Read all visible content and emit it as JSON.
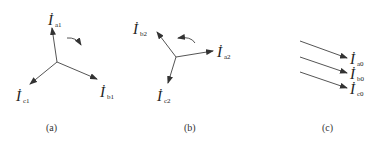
{
  "diagram": {
    "panels": [
      {
        "id": "a",
        "caption": "(a)",
        "type": "positive-sequence phasors",
        "rotation": "clockwise",
        "phasors": [
          {
            "symbol": "İ",
            "sub": "a1"
          },
          {
            "symbol": "İ",
            "sub": "b1"
          },
          {
            "symbol": "İ",
            "sub": "c1"
          }
        ]
      },
      {
        "id": "b",
        "caption": "(b)",
        "type": "negative-sequence phasors",
        "rotation": "counterclockwise",
        "phasors": [
          {
            "symbol": "İ",
            "sub": "a2"
          },
          {
            "symbol": "İ",
            "sub": "b2"
          },
          {
            "symbol": "İ",
            "sub": "c2"
          }
        ]
      },
      {
        "id": "c",
        "caption": "(c)",
        "type": "zero-sequence phasors",
        "phasors": [
          {
            "symbol": "İ",
            "sub": "a0"
          },
          {
            "symbol": "İ",
            "sub": "b0"
          },
          {
            "symbol": "İ",
            "sub": "c0"
          }
        ]
      }
    ],
    "colors": {
      "line": "#555555",
      "text": "#222222"
    }
  }
}
